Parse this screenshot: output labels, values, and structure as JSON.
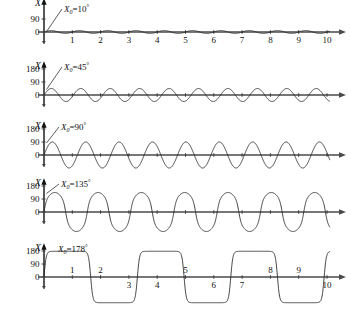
{
  "figure": {
    "axis_label_y": "X",
    "x_axis_ticks": [
      "1",
      "2",
      "3",
      "4",
      "5",
      "6",
      "7",
      "8",
      "9",
      "10"
    ],
    "curve_color": "#222222",
    "axis_color": "#4a4a4a"
  },
  "chart_data": {
    "type": "line",
    "title": "",
    "xlabel": "",
    "ylabel": "X",
    "grid": false,
    "legend": "none",
    "xlim": [
      0,
      10.6
    ],
    "x_ticks": [
      1,
      2,
      3,
      4,
      5,
      6,
      7,
      8,
      9,
      10
    ],
    "panels": [
      {
        "id": "panel-10",
        "annotation": "X₀=10°",
        "initial_angle_deg": 10,
        "y_ticks": [
          0,
          90
        ],
        "y_tick_labels": [
          "0",
          "90"
        ],
        "ylim": [
          -190,
          190
        ],
        "amplitude": 10,
        "cycles_visible": 10.2,
        "period": 1.0,
        "waveform": "sinusoidal",
        "ylabel": "X"
      },
      {
        "id": "panel-45",
        "annotation": "X₀=45°",
        "initial_angle_deg": 45,
        "y_ticks": [
          0,
          90,
          180
        ],
        "y_tick_labels": [
          "0",
          "90",
          "180"
        ],
        "ylim": [
          -190,
          190
        ],
        "amplitude": 45,
        "cycles_visible": 9.8,
        "period": 1.04,
        "waveform": "sinusoidal",
        "ylabel": "X"
      },
      {
        "id": "panel-90",
        "annotation": "X₀=90°",
        "initial_angle_deg": 90,
        "y_ticks": [
          0,
          90,
          180
        ],
        "y_tick_labels": [
          "0",
          "90",
          "180"
        ],
        "ylim": [
          -190,
          190
        ],
        "amplitude": 90,
        "cycles_visible": 8.6,
        "period": 1.18,
        "waveform": "near-sinusoidal",
        "ylabel": "X"
      },
      {
        "id": "panel-135",
        "annotation": "X₀=135°",
        "initial_angle_deg": 135,
        "y_ticks": [
          0,
          90,
          180
        ],
        "y_tick_labels": [
          "0",
          "90",
          "180"
        ],
        "ylim": [
          -190,
          190
        ],
        "amplitude": 135,
        "cycles_visible": 6.6,
        "period": 1.53,
        "waveform": "broadened",
        "ylabel": "X"
      },
      {
        "id": "panel-178",
        "annotation": "X₀=178°",
        "initial_angle_deg": 178,
        "y_ticks": [
          0,
          90,
          180
        ],
        "y_tick_labels": [
          "0",
          "90",
          "180"
        ],
        "ylim": [
          -195,
          195
        ],
        "amplitude": 178,
        "cycles_visible": 3.05,
        "period": 3.3,
        "waveform": "flat-topped",
        "ylabel": "X"
      }
    ]
  }
}
